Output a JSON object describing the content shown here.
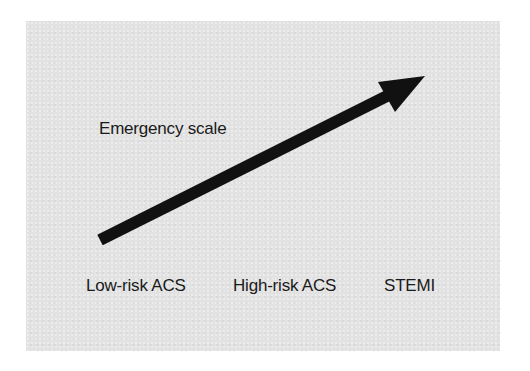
{
  "diagram": {
    "title": "Emergency scale",
    "levels": [
      "Low-risk ACS",
      "High-risk ACS",
      "STEMI"
    ],
    "arrow": {
      "direction": "up-right",
      "color": "#111111"
    },
    "background_color": "#e2e2e2"
  }
}
